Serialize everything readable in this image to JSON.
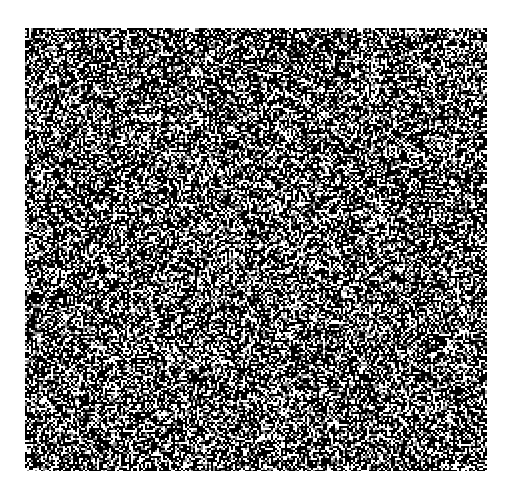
{
  "figure": {
    "background_color": "#ffffff",
    "panel": {
      "type": "random-dot-noise",
      "x": 25,
      "y": 28,
      "width": 462,
      "height": 443,
      "dot_size": 2,
      "dark_fraction": 0.56,
      "dark_color": "#0a0a0a",
      "light_color": "#f2f2f2",
      "mid_gray_fraction": 0.12,
      "mid_gray_color": "#8a8a8a",
      "seed": 1337
    }
  }
}
